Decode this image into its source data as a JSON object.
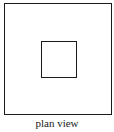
{
  "diagram": {
    "caption": "plan view",
    "shapes": [
      {
        "name": "outer-square",
        "type": "square"
      },
      {
        "name": "inner-square",
        "type": "square"
      }
    ],
    "stroke_color": "#1a1a1a"
  }
}
